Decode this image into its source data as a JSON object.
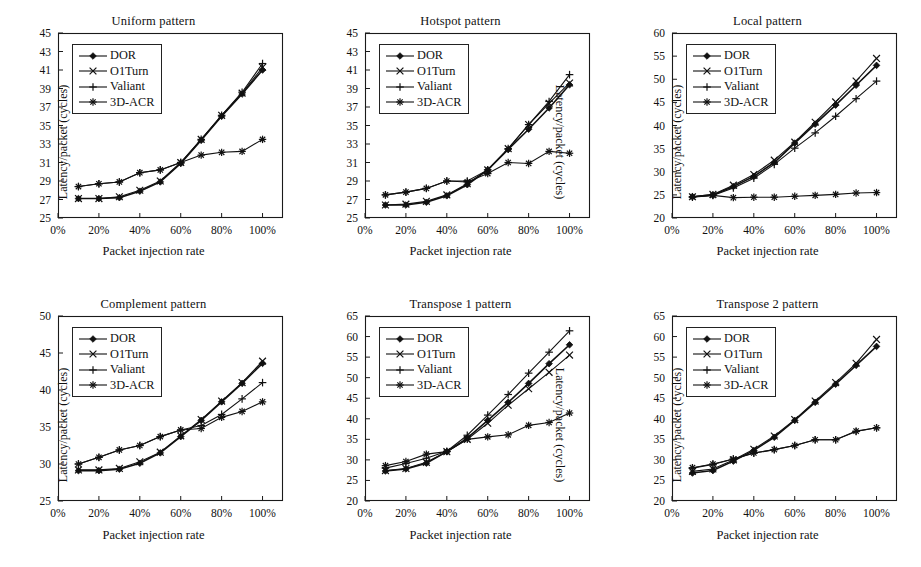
{
  "figure": {
    "series_names": [
      "DOR",
      "O1Turn",
      "Valiant",
      "3D-ACR"
    ],
    "markers": [
      "filled-diamond",
      "x-cross",
      "plus",
      "asterisk"
    ],
    "x_tick_labels": [
      "0%",
      "20%",
      "40%",
      "60%",
      "80%",
      "100%"
    ],
    "axis_color": "#1a1a1a",
    "line_color": "#111111",
    "background": "#ffffff"
  },
  "chart_data": [
    {
      "type": "line",
      "title": "Uniform pattern",
      "xlabel": "Packet injection rate",
      "ylabel": "Latency/packet (cycles)",
      "xlim": [
        0,
        110
      ],
      "ylim": [
        25,
        45
      ],
      "ytick_step": 2,
      "ytick_labels": [
        "25",
        "27",
        "29",
        "31",
        "33",
        "35",
        "37",
        "39",
        "41",
        "43",
        "45"
      ],
      "xtick_labels": [
        "0%",
        "20%",
        "40%",
        "60%",
        "80%",
        "100%"
      ],
      "x": [
        10,
        20,
        30,
        40,
        50,
        60,
        70,
        80,
        90,
        100
      ],
      "grid": false,
      "legend_position": "top-left",
      "series": [
        {
          "name": "DOR",
          "values": [
            27.1,
            27.1,
            27.2,
            27.9,
            28.9,
            30.9,
            33.4,
            36.0,
            38.4,
            41.0
          ]
        },
        {
          "name": "O1Turn",
          "values": [
            27.1,
            27.1,
            27.3,
            28.0,
            29.0,
            31.0,
            33.5,
            36.1,
            38.5,
            41.3
          ]
        },
        {
          "name": "Valiant",
          "values": [
            28.4,
            28.7,
            28.9,
            29.9,
            30.2,
            31.0,
            33.5,
            36.1,
            38.6,
            41.7
          ]
        },
        {
          "name": "3D-ACR",
          "values": [
            28.4,
            28.7,
            28.9,
            29.9,
            30.2,
            31.0,
            31.8,
            32.1,
            32.2,
            33.5
          ]
        }
      ]
    },
    {
      "type": "line",
      "title": "Hotspot pattern",
      "xlabel": "Packet injection rate",
      "ylabel": "Latency/packet (cycles)",
      "ylabel_side": "right",
      "xlim": [
        0,
        110
      ],
      "ylim": [
        25,
        45
      ],
      "ytick_step": 2,
      "ytick_labels": [
        "25",
        "27",
        "29",
        "31",
        "33",
        "35",
        "37",
        "39",
        "41",
        "43",
        "45"
      ],
      "xtick_labels": [
        "0%",
        "20%",
        "40%",
        "60%",
        "80%",
        "100%"
      ],
      "x": [
        10,
        20,
        30,
        40,
        50,
        60,
        70,
        80,
        90,
        100
      ],
      "grid": false,
      "legend_position": "top-left",
      "series": [
        {
          "name": "DOR",
          "values": [
            26.4,
            26.4,
            26.7,
            27.4,
            28.6,
            30.2,
            32.4,
            34.6,
            36.9,
            39.4
          ]
        },
        {
          "name": "O1Turn",
          "values": [
            26.4,
            26.5,
            26.8,
            27.5,
            28.7,
            30.2,
            32.5,
            35.1,
            37.4,
            39.6
          ]
        },
        {
          "name": "Valiant",
          "values": [
            27.5,
            27.8,
            28.2,
            29.0,
            29.0,
            30.2,
            32.5,
            35.1,
            37.6,
            40.5
          ]
        },
        {
          "name": "3D-ACR",
          "values": [
            27.5,
            27.8,
            28.2,
            29.0,
            28.9,
            29.8,
            31.0,
            30.9,
            32.2,
            32.0
          ]
        }
      ]
    },
    {
      "type": "line",
      "title": "Local pattern",
      "xlabel": "Packet injection rate",
      "ylabel": "Latency/packet (cycles)",
      "xlim": [
        0,
        110
      ],
      "ylim": [
        20,
        60
      ],
      "ytick_step": 5,
      "ytick_labels": [
        "20",
        "25",
        "30",
        "35",
        "40",
        "45",
        "50",
        "55",
        "60"
      ],
      "xtick_labels": [
        "0%",
        "20%",
        "40%",
        "60%",
        "80%",
        "100%"
      ],
      "x": [
        10,
        20,
        30,
        40,
        50,
        60,
        70,
        80,
        90,
        100
      ],
      "grid": false,
      "legend_position": "top-left",
      "series": [
        {
          "name": "DOR",
          "values": [
            24.6,
            25.0,
            26.8,
            29.0,
            32.0,
            36.2,
            40.3,
            44.4,
            48.7,
            53.0
          ]
        },
        {
          "name": "O1Turn",
          "values": [
            24.6,
            25.1,
            27.1,
            29.4,
            32.5,
            36.4,
            40.7,
            45.1,
            49.6,
            54.5
          ]
        },
        {
          "name": "Valiant",
          "values": [
            24.5,
            24.9,
            26.5,
            28.6,
            31.6,
            35.1,
            38.4,
            42.0,
            45.8,
            49.6
          ]
        },
        {
          "name": "3D-ACR",
          "values": [
            24.6,
            24.9,
            24.4,
            24.5,
            24.5,
            24.7,
            24.9,
            25.1,
            25.4,
            25.5
          ]
        }
      ]
    },
    {
      "type": "line",
      "title": "Complement pattern",
      "xlabel": "Packet injection rate",
      "ylabel": "Latency/packet (cycles)",
      "xlim": [
        0,
        110
      ],
      "ylim": [
        25,
        50
      ],
      "ytick_step": 5,
      "ytick_labels": [
        "25",
        "30",
        "35",
        "40",
        "45",
        "50"
      ],
      "xtick_labels": [
        "0%",
        "20%",
        "40%",
        "60%",
        "80%",
        "100%"
      ],
      "x": [
        10,
        20,
        30,
        40,
        50,
        60,
        70,
        80,
        90,
        100
      ],
      "grid": false,
      "legend_position": "top-left",
      "series": [
        {
          "name": "DOR",
          "values": [
            29.1,
            29.1,
            29.3,
            30.1,
            31.5,
            33.7,
            35.9,
            38.4,
            40.9,
            43.6
          ]
        },
        {
          "name": "O1Turn",
          "values": [
            29.2,
            29.2,
            29.4,
            30.3,
            31.6,
            33.8,
            36.0,
            38.5,
            41.0,
            43.9
          ]
        },
        {
          "name": "Valiant",
          "values": [
            30.0,
            30.9,
            31.9,
            32.5,
            33.7,
            34.6,
            35.2,
            36.7,
            38.8,
            41.0
          ]
        },
        {
          "name": "3D-ACR",
          "values": [
            30.0,
            30.9,
            31.9,
            32.5,
            33.7,
            34.6,
            34.8,
            36.3,
            37.1,
            38.4
          ]
        }
      ]
    },
    {
      "type": "line",
      "title": "Transpose 1 pattern",
      "xlabel": "Packet injection rate",
      "ylabel": "Latency/packet (cycles)",
      "ylabel_side": "right",
      "xlim": [
        0,
        110
      ],
      "ylim": [
        20,
        65
      ],
      "ytick_step": 5,
      "ytick_labels": [
        "20",
        "25",
        "30",
        "35",
        "40",
        "45",
        "50",
        "55",
        "60",
        "65"
      ],
      "xtick_labels": [
        "0%",
        "20%",
        "40%",
        "60%",
        "80%",
        "100%"
      ],
      "x": [
        10,
        20,
        30,
        40,
        50,
        60,
        70,
        80,
        90,
        100
      ],
      "grid": false,
      "legend_position": "top-left",
      "series": [
        {
          "name": "DOR",
          "values": [
            27.3,
            27.8,
            29.2,
            32.0,
            35.3,
            39.6,
            44.0,
            48.6,
            53.4,
            58.0
          ]
        },
        {
          "name": "O1Turn",
          "values": [
            27.4,
            27.9,
            29.4,
            32.0,
            35.0,
            38.9,
            43.3,
            47.3,
            51.3,
            55.5
          ]
        },
        {
          "name": "Valiant",
          "values": [
            28.0,
            29.1,
            30.4,
            32.1,
            36.0,
            40.9,
            45.9,
            51.1,
            56.2,
            61.4
          ]
        },
        {
          "name": "3D-ACR",
          "values": [
            28.6,
            29.6,
            31.4,
            32.0,
            35.0,
            35.6,
            36.1,
            38.4,
            39.1,
            41.4
          ]
        }
      ]
    },
    {
      "type": "line",
      "title": "Transpose 2 pattern",
      "xlabel": "Packet injection rate",
      "ylabel": "Latency/packet (cycles)",
      "xlim": [
        0,
        110
      ],
      "ylim": [
        20,
        65
      ],
      "ytick_step": 5,
      "ytick_labels": [
        "20",
        "25",
        "30",
        "35",
        "40",
        "45",
        "50",
        "55",
        "60",
        "65"
      ],
      "xtick_labels": [
        "0%",
        "20%",
        "40%",
        "60%",
        "80%",
        "100%"
      ],
      "x": [
        10,
        20,
        30,
        40,
        50,
        60,
        70,
        80,
        90,
        100
      ],
      "grid": false,
      "legend_position": "top-left",
      "series": [
        {
          "name": "DOR",
          "values": [
            26.8,
            27.4,
            29.7,
            32.3,
            35.5,
            39.6,
            44.0,
            48.4,
            53.0,
            57.6
          ]
        },
        {
          "name": "O1Turn",
          "values": [
            27.2,
            27.8,
            30.0,
            32.6,
            35.8,
            39.8,
            44.3,
            48.8,
            53.5,
            59.3
          ]
        },
        {
          "name": "Valiant",
          "values": [
            28.0,
            28.9,
            30.2,
            31.6,
            32.5,
            33.5,
            34.9,
            34.9,
            36.9,
            37.8
          ]
        },
        {
          "name": "3D-ACR",
          "values": [
            28.1,
            29.0,
            30.2,
            31.7,
            32.5,
            33.5,
            34.9,
            34.9,
            37.0,
            37.8
          ]
        }
      ]
    }
  ]
}
